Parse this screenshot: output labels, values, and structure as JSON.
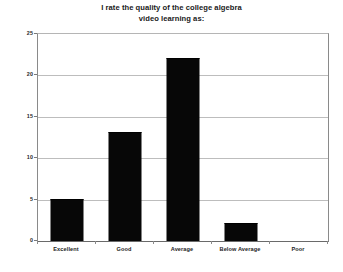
{
  "chart_data": {
    "type": "bar",
    "title": "I rate the quality of the college algebra video learning as:",
    "title_lines": [
      "I rate the quality of the college algebra",
      "video learning as:"
    ],
    "categories": [
      "Excellent",
      "Good",
      "Average",
      "Below Average",
      "Poor"
    ],
    "values": [
      5,
      13,
      22,
      2,
      0
    ],
    "xlabel": "",
    "ylabel": "",
    "ylim": [
      0,
      25
    ],
    "yticks": [
      0,
      5,
      10,
      15,
      20,
      25
    ],
    "ytick_labels": [
      "0",
      "5",
      "10",
      "15",
      "20",
      "25"
    ],
    "grid": true,
    "grid_axis": "y",
    "legend": false,
    "legend_position": "none",
    "bar_color": "#070707",
    "grid_color": "#bdbdbd",
    "axis_color": "#6a6a6a",
    "background_color": "#ffffff",
    "text_color": "#1a1a1a"
  }
}
